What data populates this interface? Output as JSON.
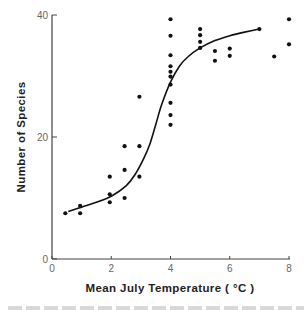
{
  "chart_data": {
    "type": "scatter",
    "title": "",
    "xlabel": "Mean July Temperature ( °C )",
    "ylabel": "Number of Species",
    "xlim": [
      0,
      8
    ],
    "ylim": [
      0,
      40
    ],
    "x_ticks": [
      "0",
      "2",
      "4",
      "6",
      "8"
    ],
    "y_ticks": [
      "0",
      "20",
      "40"
    ],
    "grid": false,
    "legend": null,
    "series": [
      {
        "name": "observations",
        "kind": "scatter",
        "points": [
          [
            0.45,
            7.5
          ],
          [
            0.95,
            8.7
          ],
          [
            0.95,
            7.5
          ],
          [
            1.95,
            13.5
          ],
          [
            1.95,
            10.6
          ],
          [
            1.95,
            9.3
          ],
          [
            2.45,
            18.5
          ],
          [
            2.45,
            14.6
          ],
          [
            2.45,
            10.0
          ],
          [
            2.95,
            26.6
          ],
          [
            2.95,
            18.5
          ],
          [
            2.95,
            13.5
          ],
          [
            4.0,
            39.3
          ],
          [
            4.0,
            36.6
          ],
          [
            4.0,
            33.4
          ],
          [
            4.0,
            31.6
          ],
          [
            4.0,
            30.7
          ],
          [
            4.0,
            29.9
          ],
          [
            4.0,
            28.6
          ],
          [
            4.0,
            25.6
          ],
          [
            4.0,
            23.6
          ],
          [
            4.0,
            22.0
          ],
          [
            5.0,
            37.7
          ],
          [
            5.0,
            36.7
          ],
          [
            5.0,
            35.6
          ],
          [
            5.0,
            34.6
          ],
          [
            5.5,
            34.1
          ],
          [
            5.5,
            32.5
          ],
          [
            6.0,
            34.5
          ],
          [
            6.0,
            33.3
          ],
          [
            7.0,
            37.7
          ],
          [
            7.5,
            33.2
          ],
          [
            8.0,
            39.3
          ],
          [
            8.0,
            35.2
          ]
        ]
      },
      {
        "name": "fitted sigmoid curve",
        "kind": "line",
        "points": [
          [
            0.55,
            7.8
          ],
          [
            1.0,
            8.5
          ],
          [
            1.5,
            9.3
          ],
          [
            2.0,
            10.3
          ],
          [
            2.5,
            12.0
          ],
          [
            2.8,
            13.8
          ],
          [
            3.1,
            16.5
          ],
          [
            3.3,
            18.8
          ],
          [
            3.5,
            22.0
          ],
          [
            3.7,
            25.3
          ],
          [
            4.0,
            29.0
          ],
          [
            4.3,
            31.6
          ],
          [
            4.6,
            33.2
          ],
          [
            5.0,
            34.6
          ],
          [
            5.5,
            35.8
          ],
          [
            6.0,
            36.6
          ],
          [
            6.5,
            37.2
          ],
          [
            7.0,
            37.7
          ]
        ]
      }
    ],
    "colors": {
      "points": "#111111",
      "curve": "#111111",
      "axes": "#444444",
      "tick_labels": "#666666"
    }
  }
}
